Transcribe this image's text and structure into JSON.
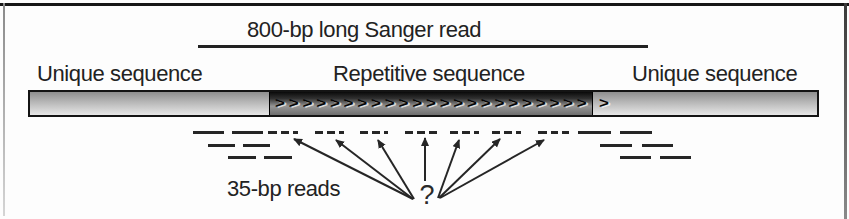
{
  "figure": {
    "top_read_label": "800-bp long Sanger read",
    "left_unique_label": "Unique sequence",
    "repeat_label": "Repetitive sequence",
    "right_unique_label": "Unique sequence",
    "reads_label": "35-bp reads",
    "question_mark": "?",
    "chevron_char": ">",
    "repeat_chevron_count": 23
  },
  "colors": {
    "line_color": "#262626",
    "bar_border": "#141414",
    "light_section_top": "#8f8f8f",
    "light_section_bottom": "#e7e7e7",
    "dark_section_top": "#0a0a0a",
    "dark_section_mid": "#969696",
    "text": "#222222"
  },
  "diagram": {
    "sanger_line": {
      "x1": 198,
      "x2": 648,
      "y": 45
    },
    "bar": {
      "x": 28,
      "y": 90,
      "w": 791,
      "h": 27,
      "sections": [
        {
          "name": "unique-left",
          "x1": 28,
          "x2": 267
        },
        {
          "name": "repetitive",
          "x1": 267,
          "x2": 591
        },
        {
          "name": "unique-right",
          "x1": 591,
          "x2": 819
        }
      ]
    },
    "solid_reads": [
      {
        "x1": 193,
        "x2": 224,
        "y": 131
      },
      {
        "x1": 232,
        "x2": 263,
        "y": 131
      },
      {
        "x1": 208,
        "x2": 235,
        "y": 144
      },
      {
        "x1": 243,
        "x2": 270,
        "y": 144
      },
      {
        "x1": 228,
        "x2": 256,
        "y": 156
      },
      {
        "x1": 264,
        "x2": 292,
        "y": 156
      },
      {
        "x1": 578,
        "x2": 611,
        "y": 131
      },
      {
        "x1": 620,
        "x2": 652,
        "y": 131
      },
      {
        "x1": 600,
        "x2": 632,
        "y": 144
      },
      {
        "x1": 642,
        "x2": 673,
        "y": 144
      },
      {
        "x1": 620,
        "x2": 651,
        "y": 156
      },
      {
        "x1": 660,
        "x2": 691,
        "y": 156
      }
    ],
    "dashed_reads": [
      {
        "x1": 268,
        "x2": 277,
        "y": 131
      },
      {
        "x1": 281,
        "x2": 289,
        "y": 131
      },
      {
        "x1": 293,
        "x2": 298,
        "y": 131
      },
      {
        "x1": 315,
        "x2": 323,
        "y": 131
      },
      {
        "x1": 327,
        "x2": 335,
        "y": 131
      },
      {
        "x1": 339,
        "x2": 344,
        "y": 131
      },
      {
        "x1": 360,
        "x2": 368,
        "y": 131
      },
      {
        "x1": 372,
        "x2": 380,
        "y": 131
      },
      {
        "x1": 384,
        "x2": 388,
        "y": 131
      },
      {
        "x1": 405,
        "x2": 413,
        "y": 131
      },
      {
        "x1": 417,
        "x2": 425,
        "y": 131
      },
      {
        "x1": 429,
        "x2": 437,
        "y": 131
      },
      {
        "x1": 450,
        "x2": 458,
        "y": 131
      },
      {
        "x1": 462,
        "x2": 470,
        "y": 131
      },
      {
        "x1": 474,
        "x2": 479,
        "y": 131
      },
      {
        "x1": 492,
        "x2": 500,
        "y": 131
      },
      {
        "x1": 504,
        "x2": 512,
        "y": 131
      },
      {
        "x1": 516,
        "x2": 521,
        "y": 131
      },
      {
        "x1": 538,
        "x2": 547,
        "y": 131
      },
      {
        "x1": 551,
        "x2": 558,
        "y": 131
      },
      {
        "x1": 562,
        "x2": 569,
        "y": 131
      }
    ],
    "arrows": [
      {
        "x1": 413,
        "y1": 199,
        "x2": 294,
        "y2": 139
      },
      {
        "x1": 413,
        "y1": 199,
        "x2": 336,
        "y2": 140
      },
      {
        "x1": 414,
        "y1": 199,
        "x2": 378,
        "y2": 140
      },
      {
        "x1": 425,
        "y1": 181,
        "x2": 425,
        "y2": 138
      },
      {
        "x1": 438,
        "y1": 198,
        "x2": 459,
        "y2": 140
      },
      {
        "x1": 439,
        "y1": 198,
        "x2": 500,
        "y2": 139
      },
      {
        "x1": 440,
        "y1": 198,
        "x2": 544,
        "y2": 140
      }
    ]
  }
}
